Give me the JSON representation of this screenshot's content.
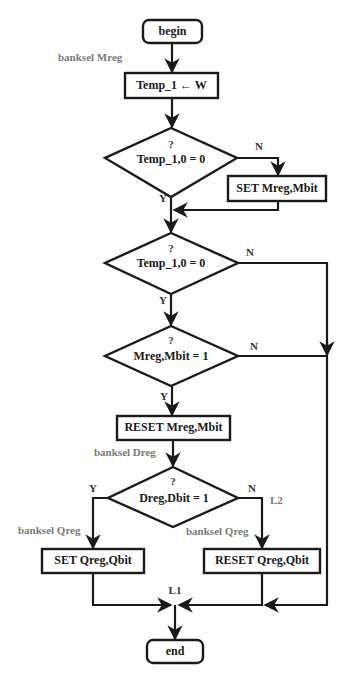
{
  "flowchart": {
    "terminals": {
      "begin": "begin",
      "end": "end"
    },
    "processes": {
      "temp_assign": "Temp_1 ← W",
      "set_mreg": "SET Mreg,Mbit",
      "reset_mreg": "RESET Mreg,Mbit",
      "set_qreg": "SET Qreg,Qbit",
      "reset_qreg": "RESET Qreg,Qbit"
    },
    "decisions": [
      {
        "question_mark": "?",
        "condition": "Temp_1,0 = 0",
        "yes": "Y",
        "no": "N"
      },
      {
        "question_mark": "?",
        "condition": "Temp_1,0 = 0",
        "yes": "Y",
        "no": "N"
      },
      {
        "question_mark": "?",
        "condition": "Mreg,Mbit = 1",
        "yes": "Y",
        "no": "N"
      },
      {
        "question_mark": "?",
        "condition": "Dreg,Dbit  = 1",
        "yes": "Y",
        "no": "N"
      }
    ],
    "annotations": {
      "banksel_mreg": "banksel Mreg",
      "banksel_dreg": "banksel Dreg",
      "banksel_qreg_left": "banksel Qreg",
      "banksel_qreg_right": "banksel Qreg",
      "label_l1": "L1",
      "label_l2": "L2"
    }
  }
}
